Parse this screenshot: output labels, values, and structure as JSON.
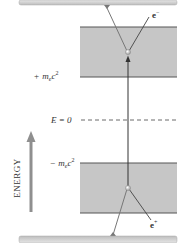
{
  "diagram": {
    "type": "energy-level",
    "axis_label": "ENERGY",
    "levels": {
      "upper_band_edge": "+m_ec^2",
      "upper_prefix": "+",
      "upper_m": "m",
      "upper_sub": "e",
      "upper_c": "c",
      "upper_sup": "2",
      "zero_line": "E = 0",
      "lower_band_edge": "−m_ec^2",
      "lower_prefix": "−",
      "lower_m": "m",
      "lower_sub": "e",
      "lower_c": "c",
      "lower_sup": "2"
    },
    "particles": {
      "electron": {
        "label": "e",
        "charge": "−"
      },
      "positron": {
        "label": "e",
        "charge": "+"
      }
    },
    "colors": {
      "band_fill": "#c4c4c4",
      "band_edge": "#555555",
      "plate_fill": "#d6d6d6",
      "axis_arrow": "#8a8a8a",
      "lines": "#444444",
      "dot": "#e8e8e8"
    }
  }
}
